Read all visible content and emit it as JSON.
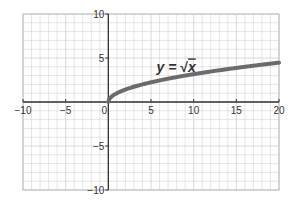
{
  "chart_data": {
    "type": "line",
    "title": "",
    "xlabel": "",
    "ylabel": "",
    "xlim": [
      -10,
      20
    ],
    "ylim": [
      -10,
      10
    ],
    "grid": true,
    "grid_step": 1,
    "x_ticks": [
      -10,
      -5,
      0,
      5,
      10,
      15,
      20
    ],
    "y_ticks": [
      -10,
      -5,
      5,
      10
    ],
    "x_tick_labels": [
      "−10",
      "−5",
      "0",
      "5",
      "10",
      "15",
      "20"
    ],
    "y_tick_labels": [
      "−10",
      "−5",
      "5",
      "10"
    ],
    "series": [
      {
        "name": "y = √x",
        "function": "sqrt(x)",
        "domain": [
          0,
          20
        ],
        "x": [
          0,
          0.25,
          1,
          2,
          4,
          6,
          9,
          12,
          16,
          20
        ],
        "y": [
          0,
          0.5,
          1,
          1.41,
          2,
          2.45,
          3,
          3.46,
          4,
          4.47
        ],
        "color": "#666666"
      }
    ],
    "annotations": [
      {
        "text_prefix": "y = ",
        "text_radical": "√",
        "text_var": "x",
        "x": 6,
        "y": 4.5
      }
    ]
  },
  "colors": {
    "grid": "#d4d4d4",
    "axis": "#333333",
    "curve": "#6b6b6b",
    "border": "#bdbdbd"
  }
}
